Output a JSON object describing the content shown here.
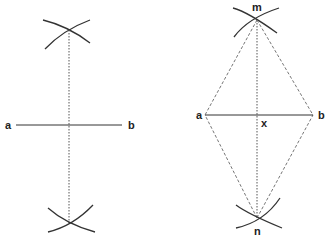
{
  "colors": {
    "line": "#333333",
    "label": "#222222",
    "background": "#ffffff"
  },
  "left_figure": {
    "labels": {
      "a": "a",
      "b": "b"
    }
  },
  "right_figure": {
    "labels": {
      "a": "a",
      "b": "b",
      "m": "m",
      "n": "n",
      "x": "x"
    }
  }
}
